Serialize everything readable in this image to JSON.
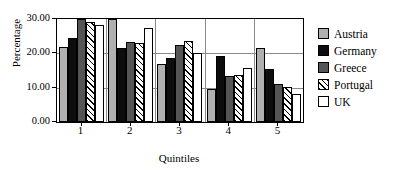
{
  "chart_data": {
    "type": "bar",
    "title": "",
    "subtitle": "",
    "xlabel": "Quintiles",
    "ylabel": "Percentage",
    "categories": [
      "1",
      "2",
      "3",
      "4",
      "5"
    ],
    "ylim": [
      0,
      30
    ],
    "yticks": [
      0,
      10,
      20,
      30
    ],
    "ytick_labels": [
      "0.00",
      "10.00",
      "20.00",
      "30.00"
    ],
    "grid": true,
    "grid_axis": "y",
    "legend_position": "right",
    "series": [
      {
        "name": "Austria",
        "color": "#b0b0b0",
        "pattern": "solid",
        "values": [
          21.8,
          30.0,
          16.9,
          9.5,
          21.5
        ]
      },
      {
        "name": "Germany",
        "color": "#0d0d0d",
        "pattern": "solid",
        "values": [
          24.5,
          21.6,
          18.5,
          19.2,
          15.5
        ]
      },
      {
        "name": "Greece",
        "color": "#555555",
        "pattern": "solid",
        "values": [
          30.0,
          23.2,
          22.5,
          13.4,
          11.1
        ]
      },
      {
        "name": "Portugal",
        "color": "#ffffff",
        "pattern": "hatch",
        "values": [
          29.2,
          22.9,
          23.5,
          13.8,
          10.2
        ]
      },
      {
        "name": "UK",
        "color": "#ffffff",
        "pattern": "empty",
        "values": [
          28.3,
          27.4,
          20.2,
          15.6,
          8.1
        ]
      }
    ]
  }
}
